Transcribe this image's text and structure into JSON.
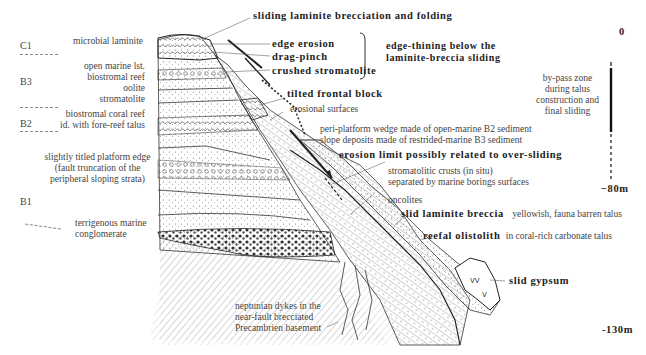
{
  "figure": {
    "type": "geological cross-section",
    "title_annotation": "sliding laminite brecciation and folding"
  },
  "units": [
    {
      "label": "C1",
      "y": 42
    },
    {
      "label": "B3",
      "y": 97
    },
    {
      "label": "B2",
      "y": 150
    },
    {
      "label": "B1",
      "y": 199
    }
  ],
  "left_labels": [
    {
      "text": "microbial laminite"
    },
    {
      "text": "open marine lst."
    },
    {
      "text": "biostromal reef"
    },
    {
      "text": "oolite"
    },
    {
      "text": "stromatolite"
    },
    {
      "text": "biostromal coral reef"
    },
    {
      "text": "id. with fore-reef talus"
    },
    {
      "text": "slightly titled platform edge"
    },
    {
      "text": "(fault truncation of the"
    },
    {
      "text": "peripheral sloping strata)"
    },
    {
      "text": "terrigenous marine"
    },
    {
      "text": "conglomerate"
    }
  ],
  "callouts": {
    "edge_erosion": "edge erosion",
    "drag_pinch": "drag-pinch",
    "crushed_stromatolite": "crushed stromatolite",
    "bracket_line1": "edge-thining below the",
    "bracket_line2": "laminite-breccia sliding",
    "tilted_frontal_block": "tilted frontal block",
    "erosional_surfaces": "erosional surfaces",
    "peri_platform_1": "peri-platform wedge made of open-marine B2 sediment",
    "peri_platform_2": "slope deposits made of restrided-marine B3 sediment",
    "erosion_limit": "erosion limit possibly related to over-sliding",
    "stromatolitic_1": "stromatolitic crusts (in situ)",
    "stromatolitic_2": "separated by marine borings surfaces",
    "oncolites": "oncolites",
    "slid_breccia_bold": "slid laminite breccia",
    "slid_breccia_desc": "yellowish, fauna barren talus",
    "olistolith_bold": "reefal olistolith",
    "olistolith_desc": "in coral-rich carbonate talus",
    "slid_gypsum": "slid gypsum",
    "neptunian_1": "neptunian dykes in the",
    "neptunian_2": "near-fault brecciated",
    "neptunian_3": "Precambrien basement"
  },
  "depth_scale": {
    "ticks": [
      "0",
      "−80m",
      "-130m"
    ],
    "bypass_1": "by-pass zone",
    "bypass_2": "during talus",
    "bypass_3": "construction and",
    "bypass_4": "final sliding"
  }
}
